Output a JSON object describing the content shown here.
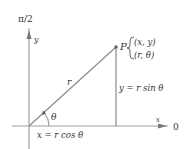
{
  "diagram": {
    "axes": {
      "vertical_top_label": "π/2",
      "vertical_axis_label": "y",
      "horizontal_axis_label": "x",
      "polar_axis_label": "0"
    },
    "point": {
      "name": "P",
      "rect_coords": "(x, y)",
      "polar_coords": "(r, θ)"
    },
    "segments": {
      "radius_label": "r",
      "angle_label": "θ",
      "x_equation": "x = r cos θ",
      "y_equation": "y = r sin θ"
    },
    "colors": {
      "axis": "#9a9a9a",
      "line": "#8a8a8a",
      "text": "#333333",
      "point": "#666666"
    }
  }
}
